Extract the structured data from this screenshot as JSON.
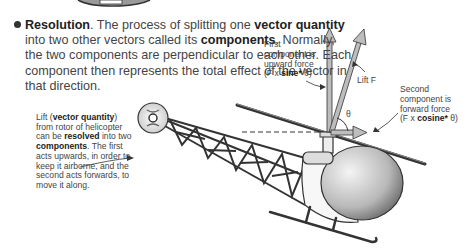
{
  "main_paragraph": {
    "term": "Resolution",
    "t1": ". The process of splitting one ",
    "b1": "vector quantity",
    "t2": " into two other vectors called its ",
    "b2": "components",
    "t3": ". Normally, the two components are perpendicular to each other. Each component then represents the total effect of the vector in that direction."
  },
  "caption": {
    "t1": "Lift (",
    "b1": "vector quantity",
    "t2": ") from rotor of helicopter can be ",
    "b2": "resolved",
    "t3": " into two ",
    "b3": "components",
    "t4": ". The first acts upwards, in order to keep it airborne, and the second acts forwards, to move it along."
  },
  "labels": {
    "first_l1": "First",
    "first_l2": "component is",
    "first_l3": "upward force",
    "first_pre": "(F x ",
    "first_bold": "sine*",
    "first_post": " θ)",
    "second_l1": "Second",
    "second_l2": "component is",
    "second_l3": "forward force",
    "second_pre": "(F x ",
    "second_bold": "cosine*",
    "second_post": " θ)",
    "lift": "Lift F",
    "theta": "θ"
  },
  "colors": {
    "text": "#444444",
    "arrow_fill": "#bdbdbd",
    "outline": "#333333"
  }
}
